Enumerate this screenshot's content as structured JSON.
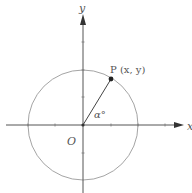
{
  "diagram": {
    "axes": {
      "x_label": "x",
      "y_label": "y",
      "origin_label": "O"
    },
    "point": {
      "label": "P (x, y)"
    },
    "angle": {
      "label": "α°"
    },
    "colors": {
      "axis": "#555555",
      "circle": "#9a9a9a",
      "radius": "#444444",
      "point": "#222222",
      "text": "#555555"
    }
  }
}
